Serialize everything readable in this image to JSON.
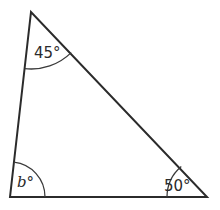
{
  "diagram": {
    "type": "triangle",
    "stroke_color": "#2b2b2b",
    "vertices": {
      "top": {
        "x": 31,
        "y": 12
      },
      "bottom_left": {
        "x": 10,
        "y": 197
      },
      "bottom_right": {
        "x": 207,
        "y": 197
      }
    },
    "angles": [
      {
        "vertex": "top",
        "label": "45°"
      },
      {
        "vertex": "bottom_left",
        "label": "b°"
      },
      {
        "vertex": "bottom_right",
        "label": "50°"
      }
    ]
  }
}
